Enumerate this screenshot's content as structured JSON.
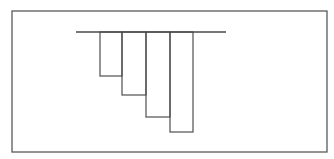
{
  "diagram": {
    "stroke_color": "#4f4f4f",
    "frame_color": "#5a5a5a",
    "background_color": "#ffffff",
    "bars": [
      {
        "name": "bar-1",
        "relative_depth": 0.44
      },
      {
        "name": "bar-2",
        "relative_depth": 0.63
      },
      {
        "name": "bar-3",
        "relative_depth": 0.85
      },
      {
        "name": "bar-4",
        "relative_depth": 1.0
      }
    ]
  }
}
